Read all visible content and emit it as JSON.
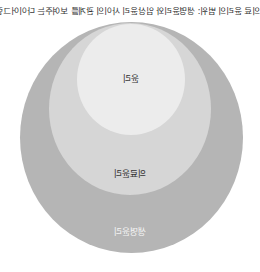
{
  "diagram": {
    "title": "의료 윤리의 범위: 생명윤리와 임상윤리 사이의 관계를 보여주는 다이어그램",
    "type": "nested-circles",
    "circles": [
      {
        "level": "outer",
        "label": "생명윤리",
        "color": "#b5b5b5"
      },
      {
        "level": "middle",
        "label": "의료윤리",
        "color": "#d6d6d6"
      },
      {
        "level": "inner",
        "label": "윤리",
        "color": "#ececec"
      }
    ]
  }
}
